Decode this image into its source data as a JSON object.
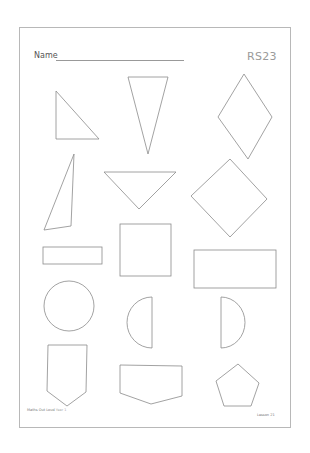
{
  "worksheet": {
    "name_label": "Name",
    "code": "RS23",
    "footer": {
      "series": "Maths Out Loud",
      "year": "Year 1",
      "lesson": "Lesson 21"
    }
  },
  "shapes": [
    {
      "type": "right-triangle"
    },
    {
      "type": "isosceles-triangle-inverted"
    },
    {
      "type": "rhombus"
    },
    {
      "type": "scalene-triangle"
    },
    {
      "type": "triangle-inverted"
    },
    {
      "type": "square-rotated"
    },
    {
      "type": "thin-rectangle"
    },
    {
      "type": "square"
    },
    {
      "type": "rectangle"
    },
    {
      "type": "circle"
    },
    {
      "type": "semicircle-left"
    },
    {
      "type": "semicircle-right"
    },
    {
      "type": "pentagon-pointed-down"
    },
    {
      "type": "pentagon-wide"
    },
    {
      "type": "regular-pentagon"
    }
  ]
}
